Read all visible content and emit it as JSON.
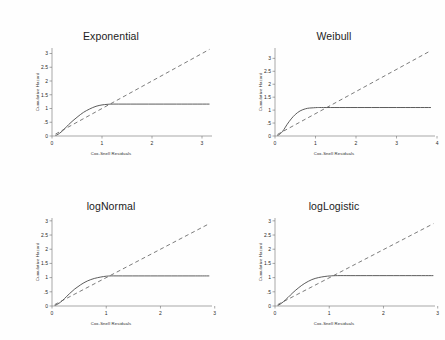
{
  "figure": {
    "background_color": "#fefefe",
    "layout": "2x2 grid of Cox-Snell residual diagnostic plots"
  },
  "chart_data": [
    {
      "type": "line",
      "title": "Exponential",
      "xlabel": "Cox-Snell Residuals",
      "ylabel": "Cumulative Hazard",
      "xlim": [
        0,
        3.2
      ],
      "ylim": [
        0,
        3.2
      ],
      "xticks": [
        "0",
        "1",
        "2",
        "3"
      ],
      "xtick_values": [
        0,
        1,
        2,
        3
      ],
      "yticks": [
        "0",
        ".5",
        "1",
        "1.5",
        "2",
        "2.5",
        "3"
      ],
      "ytick_values": [
        0,
        0.5,
        1,
        1.5,
        2,
        2.5,
        3
      ],
      "grid": false,
      "legend": "none",
      "series": [
        {
          "name": "Nelson-Aalen cumulative hazard",
          "style": "solid",
          "color": "#4a4a4a",
          "x": [
            0.07,
            0.12,
            0.18,
            0.25,
            0.33,
            0.42,
            0.52,
            0.63,
            0.75,
            0.88,
            1.0,
            1.1,
            1.2,
            1.4,
            1.8,
            2.4,
            3.15
          ],
          "y": [
            0.02,
            0.06,
            0.14,
            0.26,
            0.41,
            0.56,
            0.71,
            0.86,
            0.98,
            1.08,
            1.13,
            1.15,
            1.16,
            1.16,
            1.16,
            1.16,
            1.16
          ]
        },
        {
          "name": "45 degree reference line",
          "style": "dashed",
          "color": "#5a5a5a",
          "x": [
            0.07,
            3.15
          ],
          "y": [
            0.07,
            3.15
          ]
        }
      ]
    },
    {
      "type": "line",
      "title": "Weibull",
      "xlabel": "Cox-Snell Residuals",
      "ylabel": "Cumulative Hazard",
      "xlim": [
        0,
        3.95
      ],
      "ylim": [
        0,
        3.4
      ],
      "xticks": [
        "0",
        "1",
        "2",
        "3",
        "4"
      ],
      "xtick_values": [
        0,
        1,
        2,
        3,
        4
      ],
      "yticks": [
        "0",
        ".5",
        "1",
        "1.5",
        "2",
        "2.5",
        "3"
      ],
      "ytick_values": [
        0,
        0.5,
        1,
        1.5,
        2,
        2.5,
        3
      ],
      "grid": false,
      "legend": "none",
      "series": [
        {
          "name": "Nelson-Aalen cumulative hazard",
          "style": "solid",
          "color": "#4a4a4a",
          "x": [
            0.06,
            0.11,
            0.16,
            0.22,
            0.3,
            0.4,
            0.5,
            0.62,
            0.75,
            0.85,
            0.95,
            1.05,
            1.2,
            1.6,
            2.2,
            3.0,
            3.85
          ],
          "y": [
            0.02,
            0.06,
            0.13,
            0.25,
            0.45,
            0.66,
            0.83,
            0.97,
            1.05,
            1.08,
            1.09,
            1.1,
            1.1,
            1.1,
            1.1,
            1.1,
            1.1
          ]
        },
        {
          "name": "45 degree reference line",
          "style": "dashed",
          "color": "#5a5a5a",
          "x": [
            0.06,
            3.85
          ],
          "y": [
            0.06,
            3.3
          ]
        }
      ]
    },
    {
      "type": "line",
      "title": "logNormal",
      "xlabel": "Cox-Snell Residuals",
      "ylabel": "Cumulative Hazard",
      "xlim": [
        0,
        2.95
      ],
      "ylim": [
        0,
        3.1
      ],
      "xticks": [
        "0",
        "1",
        "2",
        "3"
      ],
      "xtick_values": [
        0,
        1,
        2,
        3
      ],
      "yticks": [
        "0",
        ".5",
        "1",
        "1.5",
        "2",
        "2.5",
        "3"
      ],
      "ytick_values": [
        0,
        0.5,
        1,
        1.5,
        2,
        2.5,
        3
      ],
      "grid": false,
      "legend": "none",
      "series": [
        {
          "name": "Nelson-Aalen cumulative hazard",
          "style": "solid",
          "color": "#4a4a4a",
          "x": [
            0.05,
            0.1,
            0.16,
            0.23,
            0.32,
            0.42,
            0.53,
            0.65,
            0.78,
            0.9,
            1.0,
            1.1,
            1.3,
            1.7,
            2.2,
            2.6,
            2.9
          ],
          "y": [
            0.02,
            0.06,
            0.14,
            0.26,
            0.43,
            0.6,
            0.75,
            0.88,
            0.97,
            1.02,
            1.05,
            1.06,
            1.06,
            1.06,
            1.06,
            1.06,
            1.06
          ]
        },
        {
          "name": "45 degree reference line",
          "style": "dashed",
          "color": "#5a5a5a",
          "x": [
            0.05,
            2.9
          ],
          "y": [
            0.05,
            2.9
          ]
        }
      ]
    },
    {
      "type": "line",
      "title": "logLogistic",
      "xlabel": "Cox-Snell Residuals",
      "ylabel": "Cumulative Hazard",
      "xlim": [
        0,
        2.95
      ],
      "ylim": [
        0,
        3.1
      ],
      "xticks": [
        "0",
        "1",
        "2",
        "3"
      ],
      "xtick_values": [
        0,
        1,
        2,
        3
      ],
      "yticks": [
        "0",
        ".5",
        "1",
        "1.5",
        "2",
        "2.5",
        "3"
      ],
      "ytick_values": [
        0,
        0.5,
        1,
        1.5,
        2,
        2.5,
        3
      ],
      "grid": false,
      "legend": "none",
      "series": [
        {
          "name": "Nelson-Aalen cumulative hazard",
          "style": "solid",
          "color": "#4a4a4a",
          "x": [
            0.05,
            0.1,
            0.16,
            0.24,
            0.33,
            0.44,
            0.55,
            0.68,
            0.8,
            0.92,
            1.02,
            1.15,
            1.4,
            1.8,
            2.3,
            2.7,
            2.92
          ],
          "y": [
            0.02,
            0.07,
            0.16,
            0.3,
            0.47,
            0.65,
            0.8,
            0.93,
            1.0,
            1.04,
            1.06,
            1.07,
            1.07,
            1.07,
            1.07,
            1.07,
            1.07
          ]
        },
        {
          "name": "45 degree reference line",
          "style": "dashed",
          "color": "#5a5a5a",
          "x": [
            0.05,
            2.92
          ],
          "y": [
            0.05,
            2.9
          ]
        }
      ]
    }
  ]
}
